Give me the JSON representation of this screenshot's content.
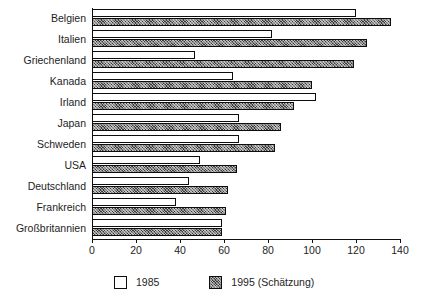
{
  "chart_data": {
    "type": "bar",
    "orientation": "horizontal",
    "title": "",
    "xlabel": "",
    "ylabel": "",
    "xlim": [
      0,
      140
    ],
    "xticks": [
      0,
      20,
      40,
      60,
      80,
      100,
      120,
      140
    ],
    "grid": false,
    "legend_position": "bottom",
    "categories": [
      "Belgien",
      "Italien",
      "Griechenland",
      "Kanada",
      "Irland",
      "Japan",
      "Schweden",
      "USA",
      "Deutschland",
      "Frankreich",
      "Großbritannien"
    ],
    "series": [
      {
        "name": "1985",
        "fill": "white",
        "values": [
          120,
          82,
          47,
          64,
          102,
          67,
          67,
          49,
          44,
          38,
          59
        ]
      },
      {
        "name": "1995 (Schätzung)",
        "fill": "hatched-dark",
        "values": [
          136,
          125,
          119,
          100,
          92,
          86,
          83,
          66,
          62,
          61,
          59
        ]
      }
    ]
  },
  "legend": {
    "items": [
      {
        "label": "1985",
        "swatch": "white-square-icon"
      },
      {
        "label": "1995 (Schätzung)",
        "swatch": "hatched-square-icon"
      }
    ]
  },
  "colors": {
    "bar_1985": "#ffffff",
    "bar_1995": "#3a3a3a",
    "outline": "#0d0d0d",
    "axis": "#111111",
    "text": "#1d1d1d",
    "background": "#ffffff"
  }
}
